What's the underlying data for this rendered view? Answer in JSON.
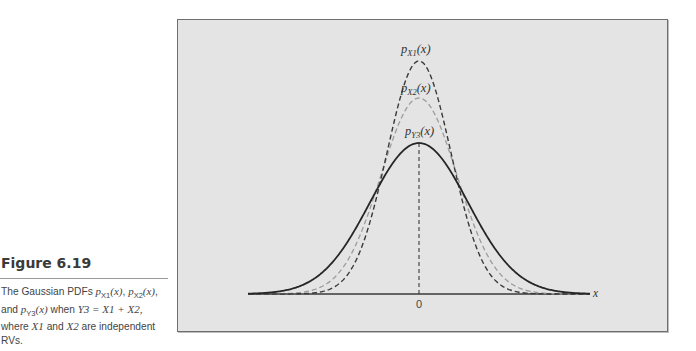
{
  "figure": {
    "title": "Figure 6.19",
    "caption_parts": {
      "p1": "The Gaussian PDFs ",
      "px1": "p",
      "px1_sub": "X1",
      "px1_arg": "(x)",
      "sep1": ", ",
      "px2": "p",
      "px2_sub": "X2",
      "px2_arg": "(x)",
      "sep2": ",",
      "p2": "and ",
      "py3": "p",
      "py3_sub": "Y3",
      "py3_arg": "(x)",
      "p3": " when ",
      "eq": "Y3 = X1 + X2,",
      "p4": "where ",
      "x1": "X1",
      "p5": " and ",
      "x2": "X2",
      "p6": " are independent",
      "p7": "RVs."
    }
  },
  "chart_data": {
    "type": "line",
    "xlabel": "x",
    "ylabel": "",
    "x_ticks": [
      "0"
    ],
    "grid": false,
    "legend": "inline labels above peaks",
    "series": [
      {
        "name": "p_X1(x)",
        "style": "dashed",
        "color": "#3a3a3a",
        "mean": 0,
        "relative_sigma": 0.65,
        "relative_peak": 1.54
      },
      {
        "name": "p_X2(x)",
        "style": "dashed",
        "color": "#9a9a9a",
        "mean": 0,
        "relative_sigma": 0.77,
        "relative_peak": 1.3
      },
      {
        "name": "p_Y3(x)",
        "style": "solid",
        "color": "#2a2a2a",
        "mean": 0,
        "relative_sigma": 1.0,
        "relative_peak": 1.0
      }
    ],
    "annotations": [
      "p_X1(x)",
      "p_X2(x)",
      "p_Y3(x)",
      "dashed vertical line at x = 0"
    ],
    "labels": {
      "x_axis": "x",
      "zero": "0",
      "px1": "p",
      "px1_sub": "X1",
      "px1_arg": "(x)",
      "px2": "p",
      "px2_sub": "X2",
      "px2_arg": "(x)",
      "py3": "p",
      "py3_sub": "Y3",
      "py3_arg": "(x)"
    },
    "geometry": {
      "center_x": 419,
      "baseline_y": 294,
      "x_start": 248,
      "x_end": 590,
      "sigma_px": {
        "X1": 32,
        "X2": 38,
        "Y3": 49
      },
      "peak_px": {
        "X1": 233,
        "X2": 196,
        "Y3": 151
      }
    },
    "colors": {
      "panel": "#e4e4e4",
      "border": "#6e6e6e",
      "axis": "#3a3a3a"
    }
  }
}
